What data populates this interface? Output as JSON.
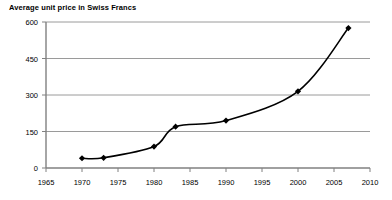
{
  "chart_data": {
    "type": "line",
    "title": "Average unit price in Swiss Francs",
    "xlabel": "",
    "ylabel": "",
    "xlim": [
      1965,
      2010
    ],
    "ylim": [
      0,
      600
    ],
    "grid": "horizontal",
    "legend": "none",
    "marker": "diamond",
    "line_color": "#000000",
    "grid_color": "#9a9a9a",
    "axis_color": "#808080",
    "x_ticks": [
      1965,
      1970,
      1975,
      1980,
      1985,
      1990,
      1995,
      2000,
      2005,
      2010
    ],
    "y_ticks": [
      0,
      150,
      300,
      450,
      600
    ],
    "x": [
      1970,
      1973,
      1980,
      1983,
      1990,
      2000,
      2007
    ],
    "values": [
      40,
      42,
      88,
      170,
      195,
      315,
      575
    ],
    "series": [
      {
        "name": "Average unit price",
        "points": [
          {
            "x": 1970,
            "y": 40
          },
          {
            "x": 1973,
            "y": 42
          },
          {
            "x": 1980,
            "y": 88
          },
          {
            "x": 1983,
            "y": 170
          },
          {
            "x": 1990,
            "y": 195
          },
          {
            "x": 2000,
            "y": 315
          },
          {
            "x": 2007,
            "y": 575
          }
        ]
      }
    ]
  },
  "axis": {
    "y_labels": [
      "600",
      "450",
      "300",
      "150",
      "0"
    ],
    "x_labels": [
      "1965",
      "1970",
      "1975",
      "1980",
      "1985",
      "1990",
      "1995",
      "2000",
      "2005",
      "2010"
    ]
  }
}
